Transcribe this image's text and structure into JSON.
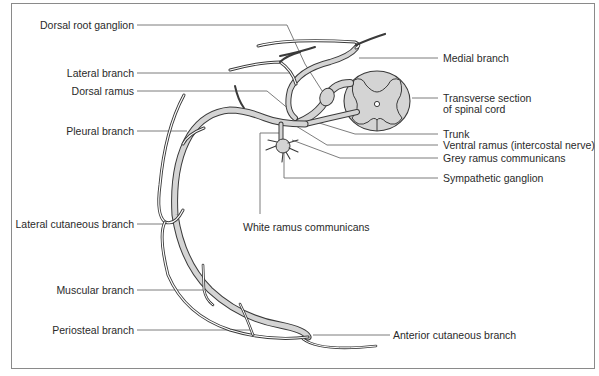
{
  "figure": {
    "type": "anatomical-diagram"
  },
  "labels_left": [
    {
      "id": "dorsal-root-ganglion",
      "text": "Dorsal root ganglion"
    },
    {
      "id": "lateral-branch",
      "text": "Lateral branch"
    },
    {
      "id": "dorsal-ramus",
      "text": "Dorsal ramus"
    },
    {
      "id": "pleural-branch",
      "text": "Pleural branch"
    },
    {
      "id": "lateral-cutaneous-branch",
      "text": "Lateral cutaneous branch"
    },
    {
      "id": "muscular-branch",
      "text": "Muscular branch"
    },
    {
      "id": "periosteal-branch",
      "text": "Periosteal branch"
    }
  ],
  "labels_right": [
    {
      "id": "medial-branch",
      "text": "Medial branch"
    },
    {
      "id": "transverse-section",
      "text": "Transverse section\nof spinal cord",
      "line1": "Transverse section",
      "line2": "of spinal cord"
    },
    {
      "id": "trunk",
      "text": "Trunk"
    },
    {
      "id": "ventral-ramus",
      "text": "Ventral ramus (intercostal nerve)"
    },
    {
      "id": "grey-ramus",
      "text": "Grey ramus communicans"
    },
    {
      "id": "sympathetic-ganglion",
      "text": "Sympathetic ganglion"
    },
    {
      "id": "anterior-cutaneous-branch",
      "text": "Anterior cutaneous branch"
    }
  ],
  "labels_center": [
    {
      "id": "white-ramus",
      "text": "White ramus communicans"
    }
  ],
  "colors": {
    "nerve_fill": "#d4d4d4",
    "nerve_outline": "#3a3a3a",
    "spinal_cord_fill": "#d4d4d4",
    "leader_line": "#6e6e6e",
    "frame": "#8a8a8a",
    "text": "#2a2a2a"
  }
}
